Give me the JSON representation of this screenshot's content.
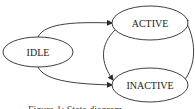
{
  "diagram": {
    "type": "state-machine",
    "stroke_color": "#2a2a2a",
    "nodes": [
      {
        "id": "idle",
        "label": "IDLE"
      },
      {
        "id": "active",
        "label": "ACTIVE"
      },
      {
        "id": "inactive",
        "label": "INACTIVE"
      }
    ],
    "edges": [
      {
        "from": "IDLE",
        "to": "ACTIVE"
      },
      {
        "from": "IDLE",
        "to": "INACTIVE"
      },
      {
        "from": "ACTIVE",
        "to": "INACTIVE"
      },
      {
        "from": "INACTIVE",
        "to": "ACTIVE"
      }
    ],
    "caption": "Figure 1: State diagram"
  }
}
